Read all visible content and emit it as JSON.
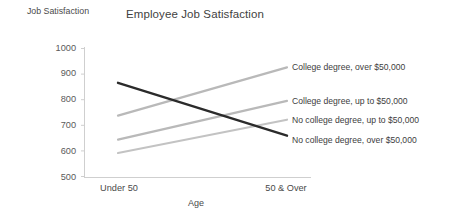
{
  "chart_data": {
    "type": "line",
    "title": "Employee Job Satisfaction",
    "xlabel": "Age",
    "ylabel": "Job Satisfaction",
    "categories": [
      "Under 50",
      "50 & Over"
    ],
    "ylim": [
      500,
      1000
    ],
    "yticks": [
      1000,
      900,
      800,
      700,
      600,
      500
    ],
    "grid": false,
    "legend_position": "right-inline",
    "series": [
      {
        "name": "College degree, over $50,000",
        "values": [
          738,
          925
        ],
        "color": "#b9b9b9"
      },
      {
        "name": "College degree, up to $50,000",
        "values": [
          645,
          795
        ],
        "color": "#b9b9b9"
      },
      {
        "name": "No college degree, up to $50,000",
        "values": [
          593,
          722
        ],
        "color": "#c3c3c3"
      },
      {
        "name": "No college degree, over $50,000",
        "values": [
          865,
          660
        ],
        "color": "#2b2b2b"
      }
    ]
  },
  "axis": {
    "y_tick_0": "1000",
    "y_tick_1": "900",
    "y_tick_2": "800",
    "y_tick_3": "700",
    "y_tick_4": "600",
    "y_tick_5": "500",
    "x_tick_0": "Under 50",
    "x_tick_1": "50 & Over"
  },
  "colors": {
    "axis": "#c8c8c8",
    "text": "#3d3d3d",
    "gray_series": "#bcbcbc",
    "dark_series": "#2b2b2b",
    "background": "#ffffff"
  }
}
